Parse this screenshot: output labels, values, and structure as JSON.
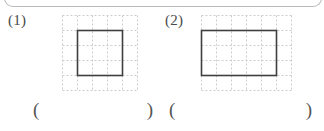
{
  "page": {
    "background_color": "#ffffff",
    "ink_color": "#3a3a3a",
    "grid_line_color": "#cccccc",
    "shape_line_color": "#3f3f3f",
    "rule_color": "#b9b9b9"
  },
  "problems": [
    {
      "label": "(1)",
      "figure": {
        "type": "rectangle-on-dashed-grid",
        "grid_cols": 5,
        "grid_rows": 5,
        "cell_size": 15,
        "shape": {
          "name": "square",
          "col_start": 1,
          "row_start": 1,
          "width_cells": 3,
          "height_cells": 3
        }
      },
      "answer": {
        "open_paren": "(",
        "close_paren": ")",
        "value": ""
      }
    },
    {
      "label": "(2)",
      "figure": {
        "type": "rectangle-on-dashed-grid",
        "grid_cols": 6,
        "grid_rows": 5,
        "cell_size": 15,
        "shape": {
          "name": "rectangle",
          "col_start": 0,
          "row_start": 1,
          "width_cells": 5,
          "height_cells": 3
        }
      },
      "answer": {
        "open_paren": "(",
        "close_paren": ")",
        "value": ""
      }
    }
  ]
}
